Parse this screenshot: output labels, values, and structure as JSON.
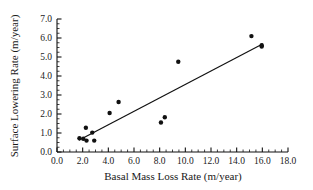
{
  "chart_data": {
    "type": "scatter",
    "title": "",
    "xlabel": "Basal Mass Loss Rate (m/year)",
    "ylabel": "Surface Lowering Rate (m/year)",
    "xlim": [
      0.0,
      18.0
    ],
    "ylim": [
      0.0,
      7.0
    ],
    "xticks": [
      "0.0",
      "2.0",
      "4.0",
      "6.0",
      "8.0",
      "10.0",
      "12.0",
      "14.0",
      "16.0",
      "18.0"
    ],
    "xtick_values": [
      0.0,
      2.0,
      4.0,
      6.0,
      8.0,
      10.0,
      12.0,
      14.0,
      16.0,
      18.0
    ],
    "yticks": [
      "0.0",
      "1.0",
      "2.0",
      "3.0",
      "4.0",
      "5.0",
      "6.0",
      "7.0"
    ],
    "ytick_values": [
      0.0,
      1.0,
      2.0,
      3.0,
      4.0,
      5.0,
      6.0,
      7.0
    ],
    "x_minor_tick_step": 0.5,
    "y_minor_tick_step": 0.25,
    "grid": false,
    "legend": null,
    "marker": "filled-circle",
    "marker_color": "#111111",
    "points": [
      {
        "x": 1.75,
        "y": 0.72
      },
      {
        "x": 2.05,
        "y": 0.7
      },
      {
        "x": 2.25,
        "y": 1.28
      },
      {
        "x": 2.3,
        "y": 0.6
      },
      {
        "x": 2.75,
        "y": 1.02
      },
      {
        "x": 2.9,
        "y": 0.6
      },
      {
        "x": 4.1,
        "y": 2.05
      },
      {
        "x": 4.8,
        "y": 2.63
      },
      {
        "x": 8.1,
        "y": 1.55
      },
      {
        "x": 8.4,
        "y": 1.83
      },
      {
        "x": 9.45,
        "y": 4.75
      },
      {
        "x": 15.15,
        "y": 6.1
      },
      {
        "x": 15.95,
        "y": 5.62
      },
      {
        "x": 15.95,
        "y": 5.55
      }
    ],
    "trend_line": {
      "type": "linear-fit",
      "x_start": 1.7,
      "y_start": 0.62,
      "x_end": 16.05,
      "y_end": 5.7,
      "color": "#111111"
    }
  }
}
